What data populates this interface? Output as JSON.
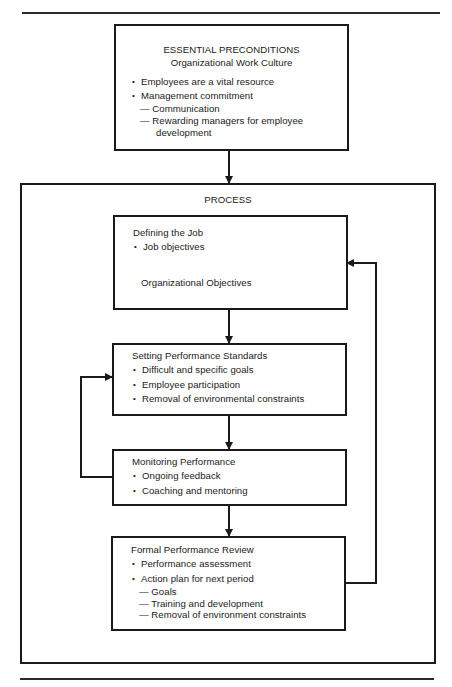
{
  "preconditions": {
    "title": "ESSENTIAL PRECONDITIONS",
    "subtitle": "Organizational Work Culture",
    "bullets": [
      "Employees are a vital resource",
      "Management commitment"
    ],
    "sub_items": [
      "— Communication",
      "— Rewarding managers for employee",
      "development"
    ]
  },
  "process": {
    "title": "PROCESS",
    "defining_job": {
      "title": "Defining the Job",
      "bullets": [
        "Job objectives"
      ],
      "result": "Organizational Objectives"
    },
    "setting_standards": {
      "title": "Setting Performance Standards",
      "bullets": [
        "Difficult and specific goals",
        "Employee participation",
        "Removal of environmental constraints"
      ]
    },
    "monitoring": {
      "title": "Monitoring Performance",
      "bullets": [
        "Ongoing feedback",
        "Coaching and mentoring"
      ]
    },
    "formal_review": {
      "title": "Formal Performance Review",
      "bullets": [
        "Performance assessment",
        "Action plan for next period"
      ],
      "sub_items": [
        "— Goals",
        "— Training and development",
        "— Removal of environment constraints"
      ]
    }
  },
  "colors": {
    "line": "#1a1a1a",
    "background": "#ffffff"
  }
}
